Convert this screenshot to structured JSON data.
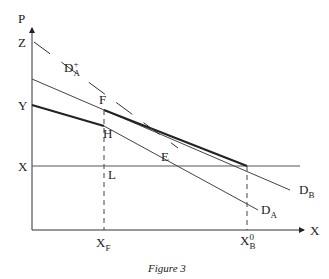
{
  "figure": {
    "caption": "Figure 3",
    "axes": {
      "y_label": "P",
      "x_label": "X"
    },
    "price_levels": {
      "z": "Z",
      "y": "Y",
      "x": "X"
    },
    "points": {
      "f": "F",
      "h": "H",
      "e": "E",
      "l": "L"
    },
    "x_ticks": {
      "xf_main": "X",
      "xf_sub": "F",
      "xb_main": "X",
      "xb_sup": "0",
      "xb_sub": "B"
    },
    "curves": {
      "da_plus_main": "D",
      "da_plus_sup": "+",
      "da_plus_sub": "A",
      "da_main": "D",
      "da_sub": "A",
      "db_main": "D",
      "db_sub": "B"
    }
  }
}
